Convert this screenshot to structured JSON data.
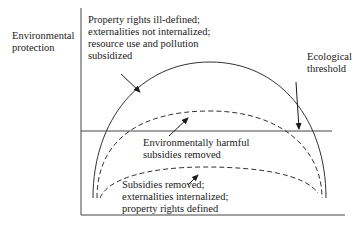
{
  "y_axis": {
    "label_lines": [
      "Environmental",
      "protection"
    ]
  },
  "annotations": {
    "outer_curve": {
      "lines": [
        "Property rights ill-defined;",
        "externalities not internalized;",
        "resource use and pollution",
        "subsidized"
      ]
    },
    "middle_curve": {
      "lines": [
        "Environmentally harmful",
        "subsidies removed"
      ]
    },
    "inner_curve": {
      "lines": [
        "Subsidies removed;",
        "externalities internalized;",
        "property rights defined"
      ]
    },
    "threshold": {
      "lines": [
        "Ecological",
        "threshold"
      ]
    }
  },
  "colors": {
    "line": "#333333",
    "text": "#1a1a1a",
    "background": "#ffffff"
  }
}
